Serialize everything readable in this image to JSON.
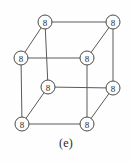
{
  "figure": {
    "caption": "(e)",
    "type": "cube-graph",
    "node_label": "8",
    "colors": {
      "background": "#fefefe",
      "edge": "#5a5a5a",
      "node_stroke": "#4a4a4a",
      "node_fill": "#fdfdfd",
      "text": "#2b2b2b"
    },
    "node_radius": 7,
    "nodes": [
      {
        "id": "back-top-left",
        "label": "8",
        "x": 45,
        "y": 22
      },
      {
        "id": "back-top-right",
        "label": "8",
        "x": 113,
        "y": 22
      },
      {
        "id": "back-bottom-left",
        "label": "8",
        "x": 21,
        "y": 58
      },
      {
        "id": "back-bottom-right",
        "label": "8",
        "x": 87,
        "y": 58
      },
      {
        "id": "front-top-left",
        "label": "8",
        "x": 48,
        "y": 87
      },
      {
        "id": "front-top-right",
        "label": "8",
        "x": 113,
        "y": 88
      },
      {
        "id": "front-bottom-left",
        "label": "8",
        "x": 22,
        "y": 124
      },
      {
        "id": "front-bottom-right",
        "label": "8",
        "x": 87,
        "y": 124
      }
    ],
    "edges": [
      {
        "id": "back-top",
        "from": "back-top-left",
        "to": "back-top-right"
      },
      {
        "id": "back-left",
        "from": "back-top-left",
        "to": "back-bottom-left"
      },
      {
        "id": "back-right",
        "from": "back-top-right",
        "to": "back-bottom-right"
      },
      {
        "id": "back-bottom",
        "from": "back-bottom-left",
        "to": "back-bottom-right"
      },
      {
        "id": "front-top",
        "from": "front-top-left",
        "to": "front-top-right"
      },
      {
        "id": "front-left",
        "from": "front-top-left",
        "to": "front-bottom-left"
      },
      {
        "id": "front-right",
        "from": "front-top-right",
        "to": "front-bottom-right"
      },
      {
        "id": "front-bottom",
        "from": "front-bottom-left",
        "to": "front-bottom-right"
      },
      {
        "id": "connect-top-left",
        "from": "back-top-left",
        "to": "front-top-left"
      },
      {
        "id": "connect-top-right",
        "from": "back-top-right",
        "to": "front-top-right"
      },
      {
        "id": "connect-bottom-left",
        "from": "back-bottom-left",
        "to": "front-bottom-left"
      },
      {
        "id": "connect-bottom-right",
        "from": "back-bottom-right",
        "to": "front-bottom-right"
      }
    ]
  }
}
